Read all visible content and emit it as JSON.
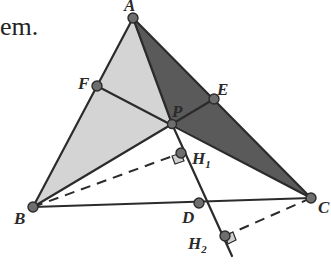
{
  "text_fragment": "em.",
  "colors": {
    "light_fill": "#d4d4d4",
    "dark_fill": "#5a5a5a",
    "stroke": "#2b2b2b",
    "point": "#6e6e6e",
    "right_angle_fill": "#cfcfcf"
  },
  "points": {
    "A": {
      "label": "A",
      "x": 133,
      "y": 18
    },
    "B": {
      "label": "B",
      "x": 33,
      "y": 207
    },
    "C": {
      "label": "C",
      "x": 311,
      "y": 198
    },
    "P": {
      "label": "P",
      "x": 172,
      "y": 124
    },
    "F": {
      "label": "F",
      "x": 97,
      "y": 86
    },
    "E": {
      "label": "E",
      "x": 214,
      "y": 99
    },
    "D": {
      "label": "D",
      "x": 199,
      "y": 203
    },
    "H1": {
      "label": "H",
      "sub": "1",
      "x": 181,
      "y": 153
    },
    "H2": {
      "label": "H",
      "sub": "2",
      "x": 225,
      "y": 236
    }
  },
  "shaded_regions": [
    {
      "name": "triangle-ABP",
      "vertices": [
        "A",
        "B",
        "P"
      ],
      "shade": "light"
    },
    {
      "name": "triangle-APC",
      "vertices": [
        "A",
        "P",
        "C"
      ],
      "shade": "dark"
    }
  ],
  "segments": [
    "AB",
    "BC",
    "CA",
    "AP",
    "BE",
    "CF",
    "PH2"
  ],
  "dashed_segments": [
    "BH1",
    "CH2"
  ],
  "right_angles": [
    "H1",
    "H2"
  ]
}
